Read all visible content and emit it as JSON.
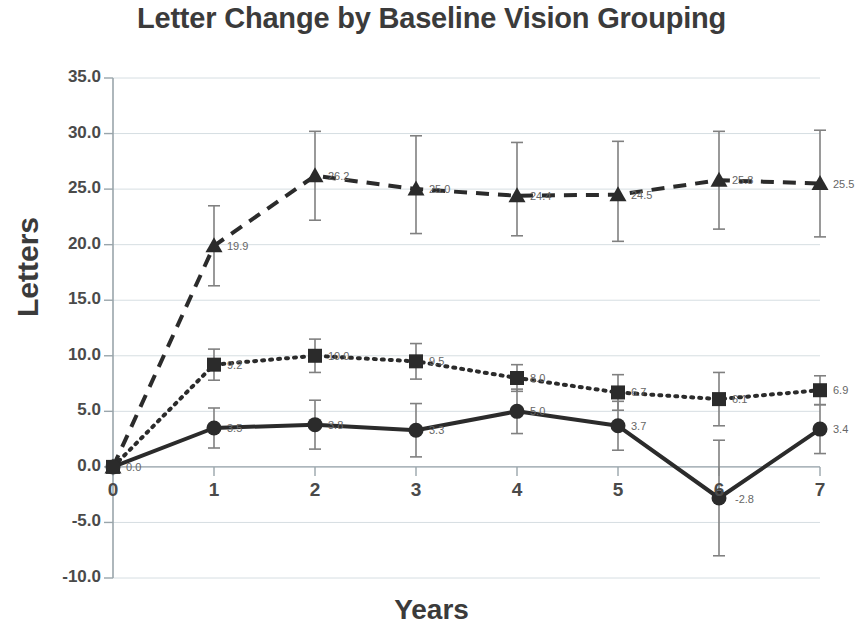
{
  "chart_data": {
    "type": "line",
    "title": "Letter Change by Baseline Vision Grouping",
    "xlabel": "Years",
    "ylabel": "Letters",
    "x": [
      0,
      1,
      2,
      3,
      4,
      5,
      6,
      7
    ],
    "xtick_labels": [
      "0",
      "1",
      "2",
      "3",
      "4",
      "5",
      "6",
      "7"
    ],
    "ytick_labels": [
      "35.0",
      "30.0",
      "25.0",
      "20.0",
      "15.0",
      "10.0",
      "5.0",
      "0.0",
      "-5.0",
      "-10.0"
    ],
    "ytick_values": [
      35,
      30,
      25,
      20,
      15,
      10,
      5,
      0,
      -5,
      -10
    ],
    "ylim": [
      -10,
      35
    ],
    "xlim": [
      0,
      7
    ],
    "grid": "horizontal",
    "legend": "none",
    "error_bars": true,
    "series": [
      {
        "name": "dashed-series",
        "line_style": "dashed",
        "marker": "triangle",
        "values": [
          0.0,
          19.9,
          26.2,
          25.0,
          24.4,
          24.5,
          25.8,
          25.5
        ],
        "labels": [
          "0.0",
          "19.9",
          "26.2",
          "25.0",
          "24.4",
          "24.5",
          "25.8",
          "25.5"
        ],
        "err_low": [
          0.0,
          3.6,
          4.0,
          4.0,
          3.6,
          4.2,
          4.4,
          4.8
        ],
        "err_high": [
          0.0,
          3.6,
          4.0,
          4.8,
          4.8,
          4.8,
          4.4,
          4.8
        ]
      },
      {
        "name": "dotted-series",
        "line_style": "dotted",
        "marker": "square",
        "values": [
          0.0,
          9.2,
          10.0,
          9.5,
          8.0,
          6.7,
          6.1,
          6.9
        ],
        "labels": [
          "0.0",
          "9.2",
          "10.0",
          "9.5",
          "8.0",
          "6.7",
          "6.1",
          "6.9"
        ],
        "err_low": [
          0.0,
          1.4,
          1.5,
          1.6,
          1.2,
          1.6,
          2.4,
          1.3
        ],
        "err_high": [
          0.0,
          1.4,
          1.5,
          1.6,
          1.2,
          1.6,
          2.4,
          1.3
        ]
      },
      {
        "name": "solid-series",
        "line_style": "solid",
        "marker": "circle",
        "values": [
          0.0,
          3.5,
          3.8,
          3.3,
          5.0,
          3.7,
          -2.8,
          3.4
        ],
        "labels": [
          "0.0",
          "3.5",
          "3.8",
          "3.3",
          "5.0",
          "3.7",
          "-2.8",
          "3.4"
        ],
        "err_low": [
          0.0,
          1.8,
          2.2,
          2.4,
          2.0,
          2.2,
          5.2,
          2.2
        ],
        "err_high": [
          0.0,
          1.8,
          2.2,
          2.4,
          2.0,
          2.2,
          5.2,
          2.2
        ]
      }
    ],
    "colors": {
      "series_line": "#2b2b2b",
      "error_bar": "#808080",
      "grid": "#d6dee2",
      "axis": "#9aa5ab",
      "text": "#3b3b3b",
      "data_label": "#666666",
      "background": "#ffffff"
    }
  }
}
